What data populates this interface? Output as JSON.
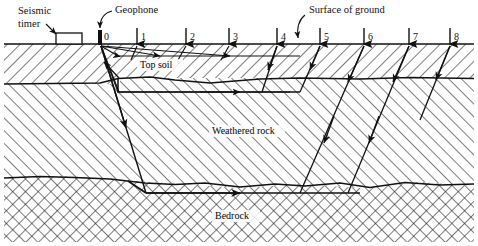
{
  "figure": {
    "type": "seismic-refraction-survey-cross-section",
    "background_color": "#ffffff",
    "line_color": "#111111"
  },
  "annotations": {
    "seismic_timer": "Seismic\ntimer",
    "seismic_timer_line1": "Seismic",
    "seismic_timer_line2": "timer",
    "geophone": "Geophone",
    "surface_of_ground": "Surface of ground"
  },
  "layers": [
    {
      "name": "Top soil",
      "hatch": "diagonal-right",
      "label_x": 170,
      "label_y": 65
    },
    {
      "name": "Weathered rock",
      "hatch": "diagonal-left",
      "label_x": 248,
      "label_y": 131
    },
    {
      "name": "Bedrock",
      "hatch": "cross-hatch",
      "label_x": 243,
      "label_y": 216
    }
  ],
  "geophones": [
    {
      "id": "0",
      "x": 100,
      "label_x": 104,
      "label_y": 40,
      "is_source": true
    },
    {
      "id": "1",
      "x": 137,
      "label_x": 141,
      "label_y": 40,
      "is_source": false
    },
    {
      "id": "2",
      "x": 186,
      "label_x": 190,
      "label_y": 40,
      "is_source": false
    },
    {
      "id": "3",
      "x": 229,
      "label_x": 233,
      "label_y": 40,
      "is_source": false
    },
    {
      "id": "4",
      "x": 277,
      "label_x": 281,
      "label_y": 40,
      "is_source": false
    },
    {
      "id": "5",
      "x": 320,
      "label_x": 324,
      "label_y": 40,
      "is_source": false
    },
    {
      "id": "6",
      "x": 364,
      "label_x": 368,
      "label_y": 40,
      "is_source": false
    },
    {
      "id": "7",
      "x": 409,
      "label_x": 413,
      "label_y": 40,
      "is_source": false
    },
    {
      "id": "8",
      "x": 450,
      "label_x": 454,
      "label_y": 40,
      "is_source": false
    }
  ],
  "boundaries": {
    "ground_surface_y": 44,
    "topsoil_base_y": 78,
    "weathered_base_y": 183
  }
}
